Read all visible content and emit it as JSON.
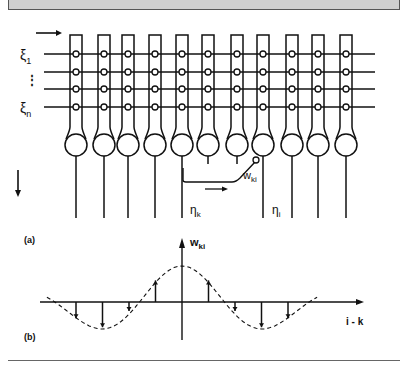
{
  "figure": {
    "panel_a_label": "(a)",
    "panel_b_label": "(b)",
    "inputs": {
      "first_label": "ξ",
      "first_sub": "1",
      "last_label": "ξ",
      "last_sub": "n",
      "ellipsis": "⋮",
      "row_y": [
        54,
        72,
        89,
        107
      ]
    },
    "neurons": {
      "x": [
        76,
        104,
        128,
        155,
        182,
        208,
        237,
        263,
        292,
        318,
        346
      ],
      "output_k_index": 4,
      "output_i_index": 7
    },
    "labels": {
      "eta_k": "η",
      "eta_k_sub": "k",
      "eta_i": "η",
      "eta_i_sub": "i",
      "w_ki": "w",
      "w_ki_sub": "ki",
      "axis_y": "w",
      "axis_y_sub": "ki",
      "axis_x": "i - k"
    }
  },
  "chart_data": {
    "type": "scatter",
    "xlabel": "i - k",
    "ylabel": "w_ki",
    "x": [
      -4,
      -3,
      -2,
      -1,
      0,
      1,
      2,
      3,
      4
    ],
    "values": [
      -0.45,
      -0.7,
      -0.25,
      0.6,
      1.0,
      0.6,
      -0.25,
      -0.7,
      -0.45
    ],
    "style": "stem plot with dashed envelope curve"
  }
}
